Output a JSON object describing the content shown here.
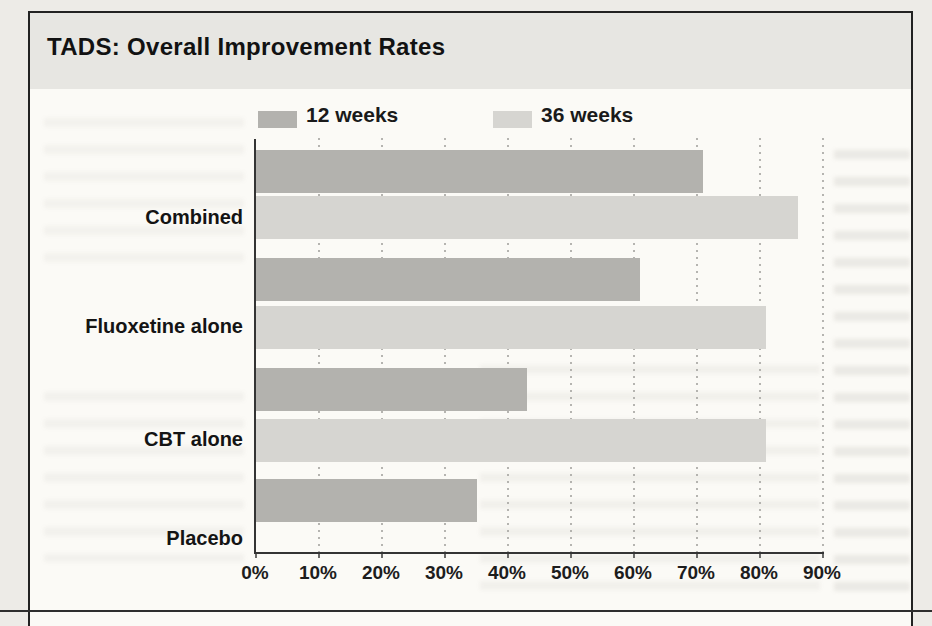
{
  "page": {
    "kind": "scanned-book-figure"
  },
  "chart_data": {
    "type": "bar",
    "orientation": "horizontal",
    "title": "TADS: Overall Improvement Rates",
    "categories": [
      "Combined",
      "Fluoxetine alone",
      "CBT alone",
      "Placebo"
    ],
    "series": [
      {
        "name": "12 weeks",
        "color": "#b3b2ae",
        "values": [
          71,
          61,
          43,
          35
        ]
      },
      {
        "name": "36 weeks",
        "color": "#d6d5d1",
        "values": [
          86,
          81,
          81,
          null
        ]
      }
    ],
    "xlabel": "",
    "ylabel": "",
    "x_ticks": [
      "0%",
      "10%",
      "20%",
      "30%",
      "40%",
      "50%",
      "60%",
      "70%",
      "80%",
      "90%"
    ],
    "xlim": [
      0,
      90
    ],
    "unit": "%",
    "grid": "dotted vertical gridlines every 10%",
    "legend_position": "top, above plot",
    "layout_note": "Placebo group shows only a 12-week bar; no 36-week bar"
  }
}
